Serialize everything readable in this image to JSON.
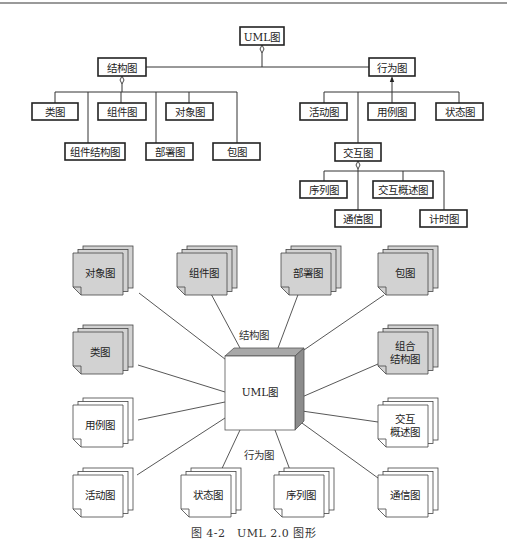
{
  "hierarchy": {
    "root": {
      "label": "UML图",
      "box": [
        240,
        27,
        44,
        18
      ]
    },
    "structural": {
      "label": "结构图",
      "box": [
        98,
        58,
        48,
        18
      ]
    },
    "behavioral": {
      "label": "行为图",
      "box": [
        369,
        58,
        46,
        18
      ]
    },
    "interaction": {
      "label": "交互图",
      "box": [
        335,
        143,
        46,
        18
      ]
    },
    "structural_children": [
      {
        "label": "类图",
        "box": [
          32,
          103,
          46,
          17
        ],
        "anchor_x": 55
      },
      {
        "label": "组件图",
        "box": [
          98,
          103,
          48,
          17
        ],
        "anchor_x": 121
      },
      {
        "label": "对象图",
        "box": [
          166,
          103,
          47,
          17
        ],
        "anchor_x": 189
      },
      {
        "label": "组件结构图",
        "box": [
          65,
          143,
          60,
          17
        ],
        "anchor_x": 88
      },
      {
        "label": "部署图",
        "box": [
          146,
          143,
          47,
          17
        ],
        "anchor_x": 156
      },
      {
        "label": "包图",
        "box": [
          213,
          143,
          47,
          17
        ],
        "anchor_x": 237
      }
    ],
    "behavioral_children": [
      {
        "label": "活动图",
        "box": [
          300,
          103,
          47,
          17
        ],
        "anchor_x": 324
      },
      {
        "label": "用例图",
        "box": [
          368,
          103,
          47,
          17
        ],
        "anchor_x": 392
      },
      {
        "label": "状态图",
        "box": [
          436,
          103,
          47,
          17
        ],
        "anchor_x": 459
      }
    ],
    "interaction_children": [
      {
        "label": "序列图",
        "box": [
          300,
          181,
          47,
          17
        ],
        "anchor_x": 324
      },
      {
        "label": "交互概述图",
        "box": [
          373,
          181,
          60,
          17
        ],
        "anchor_x": 403
      },
      {
        "label": "通信图",
        "box": [
          335,
          210,
          46,
          17
        ],
        "anchor_x": 358
      },
      {
        "label": "计时图",
        "box": [
          420,
          210,
          47,
          17
        ],
        "anchor_x": 444
      }
    ]
  },
  "overview": {
    "center": {
      "label": "UML图"
    },
    "group_labels": {
      "structural": "结构图",
      "behavioral": "行为图"
    },
    "colors": {
      "structural_fill": "#d2d2d2",
      "behavioral_fill": "#ffffff",
      "cube_top": "#a8a8a8",
      "cube_side": "#8c8c8c"
    },
    "structural_docs": [
      {
        "lines": [
          "对象图"
        ],
        "x": 73,
        "y": 253,
        "end": [
          130,
          290
        ]
      },
      {
        "lines": [
          "组件图"
        ],
        "x": 177,
        "y": 253,
        "end": [
          214,
          292
        ]
      },
      {
        "lines": [
          "部署图"
        ],
        "x": 281,
        "y": 253,
        "end": [
          300,
          292
        ]
      },
      {
        "lines": [
          "包图"
        ],
        "x": 378,
        "y": 253,
        "end": [
          385,
          294
        ]
      },
      {
        "lines": [
          "类图"
        ],
        "x": 73,
        "y": 332,
        "end": [
          130,
          365
        ]
      },
      {
        "lines": [
          "组合",
          "结构图"
        ],
        "x": 378,
        "y": 332,
        "end": [
          379,
          360
        ]
      }
    ],
    "behavioral_docs": [
      {
        "lines": [
          "用例图"
        ],
        "x": 73,
        "y": 405,
        "end": [
          136,
          418
        ]
      },
      {
        "lines": [
          "交互",
          "概述图"
        ],
        "x": 378,
        "y": 405,
        "end": [
          379,
          420
        ]
      },
      {
        "lines": [
          "活动图"
        ],
        "x": 73,
        "y": 475,
        "end": [
          136,
          467
        ]
      },
      {
        "lines": [
          "状态图"
        ],
        "x": 181,
        "y": 475,
        "end": [
          217,
          468
        ]
      },
      {
        "lines": [
          "序列图"
        ],
        "x": 274,
        "y": 475,
        "end": [
          293,
          476
        ]
      },
      {
        "lines": [
          "通信图"
        ],
        "x": 378,
        "y": 475,
        "end": [
          379,
          477
        ]
      }
    ]
  },
  "caption": "图 4-2　UML 2.0 图形"
}
